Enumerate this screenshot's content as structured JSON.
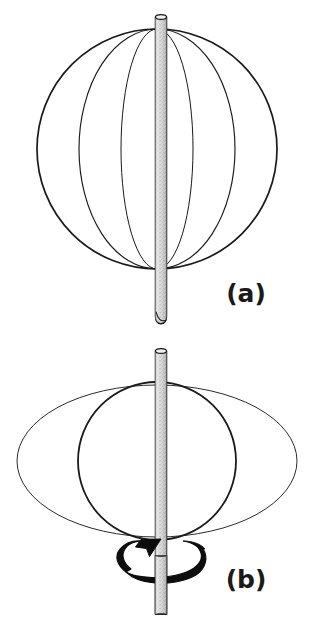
{
  "figure": {
    "background_color": "#ffffff",
    "ink_color": "#1a1a1a",
    "rod_fill_color": "#d8d8d8",
    "width": 314,
    "height": 622,
    "panels": [
      {
        "id": "a",
        "label": "(a)",
        "label_x": 246,
        "label_y": 302,
        "description": "Stationary sphere threaded on a vertical rod; outer circle plus two meridian ellipses",
        "rod": {
          "x_left": 155,
          "x_right": 166,
          "y_top": 14,
          "y_bottom": 324,
          "stipple": true
        },
        "shapes": [
          {
            "name": "sphere-outline",
            "type": "circle",
            "cx": 157,
            "cy": 149,
            "r": 120,
            "stroke_width": 1.6
          },
          {
            "name": "meridian-ellipse-wide",
            "type": "ellipse",
            "cx": 157,
            "cy": 149,
            "rx": 78,
            "ry": 120,
            "stroke_width": 1.1
          },
          {
            "name": "meridian-ellipse-narrow",
            "type": "ellipse",
            "cx": 157,
            "cy": 149,
            "rx": 36,
            "ry": 120,
            "stroke_width": 1.0
          }
        ]
      },
      {
        "id": "b",
        "label": "(b)",
        "label_x": 246,
        "label_y": 588,
        "description": "Rotating sphere: equatorial circle flattened into a wide ellipse, with a curved rotation arrow around the rod",
        "rod": {
          "x_left": 155,
          "x_right": 166,
          "y_top": 348,
          "y_bottom": 612,
          "stipple": true
        },
        "shapes": [
          {
            "name": "oblate-equator-ellipse",
            "type": "ellipse",
            "cx": 157,
            "cy": 461,
            "rx": 140,
            "ry": 76,
            "stroke_width": 1.0
          },
          {
            "name": "sphere-outline",
            "type": "circle",
            "cx": 157,
            "cy": 461,
            "r": 79,
            "stroke_width": 1.7
          }
        ],
        "rotation_arrow": {
          "name": "rotation-arrow",
          "direction": "counterclockwise-viewed-from-above",
          "center_x": 157,
          "center_y": 562,
          "rx": 47,
          "ry": 19
        }
      }
    ]
  }
}
